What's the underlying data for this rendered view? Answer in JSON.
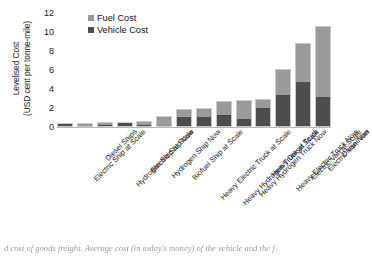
{
  "chart_data": {
    "type": "bar",
    "subtype": "stacked-vertical",
    "title": "",
    "xlabel": "",
    "ylabel": "Levelised Cost (USD cent per tonne-mile)",
    "ylabel_line1": "Levelised Cost",
    "ylabel_line2": "(USD cent per tonne-mile)",
    "ylim": [
      0,
      12
    ],
    "yticks": [
      0,
      2,
      4,
      6,
      8,
      10,
      12
    ],
    "grid": false,
    "legend_position": "top-left-inside",
    "categories": [
      "Electric Ship at Scale",
      "Diesel Ships",
      "Hydrogen Ship at Scale",
      "Electric Ship Now",
      "Hydrogen Ship Now",
      "Biofuel Ship at Scale",
      "Heavy Electric Truck at Scale",
      "Heavy Hydrogen Truck at Scale",
      "Heavy Hydrogen Truck Now",
      "Heavy Diesel Truck",
      "Heavy Electric Truck Now",
      "Electric Van at Scale",
      "Electric Van Now",
      "Diesel Van"
    ],
    "series": [
      {
        "name": "Vehicle Cost",
        "color": "#4d4d4d",
        "values": [
          0.3,
          0.12,
          0.2,
          0.45,
          0.2,
          0.05,
          1.1,
          1.05,
          1.25,
          0.85,
          1.95,
          3.35,
          4.7,
          3.2
        ]
      },
      {
        "name": "Fuel Cost",
        "color": "#9a9a9a",
        "values": [
          0.05,
          0.33,
          0.3,
          0.1,
          0.45,
          1.05,
          0.8,
          1.0,
          1.45,
          1.95,
          1.05,
          2.75,
          4.1,
          7.4
        ]
      }
    ],
    "totals": [
      0.35,
      0.45,
      0.5,
      0.55,
      0.65,
      1.1,
      1.9,
      2.05,
      2.7,
      2.8,
      3.0,
      6.1,
      8.8,
      10.6
    ]
  },
  "legend": {
    "entries": [
      {
        "label": "Fuel Cost",
        "color": "#9a9a9a"
      },
      {
        "label": "Vehicle Cost",
        "color": "#4d4d4d"
      }
    ]
  },
  "caption": {
    "text": "d cost of goods freight.  Average cost (in today's money) of the vehicle and the f"
  },
  "colors": {
    "fuel": "#9a9a9a",
    "vehicle": "#4d4d4d",
    "axis": "#b9b9b9",
    "text": "#1a1a1a"
  }
}
